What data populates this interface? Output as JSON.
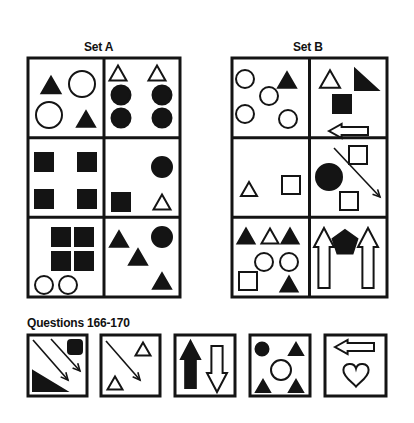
{
  "set_a": {
    "title": "Set A",
    "grid": {
      "x": 28,
      "y": 58,
      "w": 152,
      "h": 239,
      "cols": 2,
      "rows": 3,
      "stroke": 3
    },
    "cells": [
      {
        "name": "a-r1c1",
        "shapes": [
          {
            "t": "tri",
            "cx": 51,
            "cy": 85,
            "s": 19,
            "fill": true
          },
          {
            "t": "circle",
            "cx": 82,
            "cy": 84,
            "r": 13,
            "fill": false
          },
          {
            "t": "circle",
            "cx": 49,
            "cy": 115,
            "r": 13,
            "fill": false
          },
          {
            "t": "tri",
            "cx": 86,
            "cy": 119,
            "s": 18,
            "fill": true
          }
        ]
      },
      {
        "name": "a-r1c2",
        "shapes": [
          {
            "t": "tri",
            "cx": 118,
            "cy": 73,
            "s": 17,
            "fill": false
          },
          {
            "t": "tri",
            "cx": 157,
            "cy": 73,
            "s": 17,
            "fill": false
          },
          {
            "t": "circle",
            "cx": 121,
            "cy": 95,
            "r": 9.5,
            "fill": true
          },
          {
            "t": "circle",
            "cx": 162,
            "cy": 95,
            "r": 9.5,
            "fill": true
          },
          {
            "t": "circle",
            "cx": 121,
            "cy": 118,
            "r": 9.5,
            "fill": true
          },
          {
            "t": "circle",
            "cx": 162,
            "cy": 118,
            "r": 9.5,
            "fill": true
          }
        ]
      },
      {
        "name": "a-r2c1",
        "shapes": [
          {
            "t": "rect",
            "x": 35,
            "y": 153,
            "w": 18,
            "h": 18,
            "fill": true
          },
          {
            "t": "rect",
            "x": 78,
            "y": 153,
            "w": 18,
            "h": 18,
            "fill": true
          },
          {
            "t": "rect",
            "x": 35,
            "y": 190,
            "w": 18,
            "h": 18,
            "fill": true
          },
          {
            "t": "rect",
            "x": 78,
            "y": 190,
            "w": 18,
            "h": 18,
            "fill": true
          }
        ]
      },
      {
        "name": "a-r2c2",
        "shapes": [
          {
            "t": "circle",
            "cx": 162,
            "cy": 167,
            "r": 10,
            "fill": true
          },
          {
            "t": "rect",
            "x": 112,
            "y": 193,
            "w": 18,
            "h": 18,
            "fill": true
          },
          {
            "t": "tri",
            "cx": 162,
            "cy": 202,
            "s": 17,
            "fill": false
          }
        ]
      },
      {
        "name": "a-r3c1",
        "shapes": [
          {
            "t": "rect",
            "x": 52,
            "y": 228,
            "w": 18,
            "h": 18,
            "fill": true
          },
          {
            "t": "rect",
            "x": 75,
            "y": 228,
            "w": 18,
            "h": 18,
            "fill": true
          },
          {
            "t": "rect",
            "x": 52,
            "y": 252,
            "w": 18,
            "h": 18,
            "fill": true
          },
          {
            "t": "rect",
            "x": 75,
            "y": 252,
            "w": 18,
            "h": 18,
            "fill": true
          },
          {
            "t": "circle",
            "cx": 44,
            "cy": 285,
            "r": 9,
            "fill": false
          },
          {
            "t": "circle",
            "cx": 68,
            "cy": 285,
            "r": 9,
            "fill": false
          }
        ]
      },
      {
        "name": "a-r3c2",
        "shapes": [
          {
            "t": "tri",
            "cx": 119,
            "cy": 239,
            "s": 18,
            "fill": true
          },
          {
            "t": "circle",
            "cx": 162,
            "cy": 237,
            "r": 10,
            "fill": true
          },
          {
            "t": "tri",
            "cx": 138,
            "cy": 257,
            "s": 18,
            "fill": true
          },
          {
            "t": "tri",
            "cx": 162,
            "cy": 281,
            "s": 18,
            "fill": true
          }
        ]
      }
    ]
  },
  "set_b": {
    "title": "Set B",
    "grid": {
      "x": 232,
      "y": 58,
      "w": 155,
      "h": 239,
      "cols": 2,
      "rows": 3,
      "stroke": 3
    },
    "cells": [
      {
        "name": "b-r1c1",
        "shapes": [
          {
            "t": "circle",
            "cx": 245,
            "cy": 79,
            "r": 9,
            "fill": false
          },
          {
            "t": "tri",
            "cx": 287,
            "cy": 80,
            "s": 18,
            "fill": true
          },
          {
            "t": "circle",
            "cx": 269,
            "cy": 96,
            "r": 9,
            "fill": false
          },
          {
            "t": "circle",
            "cx": 245,
            "cy": 114,
            "r": 9,
            "fill": false
          },
          {
            "t": "circle",
            "cx": 288,
            "cy": 119,
            "r": 9,
            "fill": false
          }
        ]
      },
      {
        "name": "b-r1c2",
        "shapes": [
          {
            "t": "tri",
            "cx": 330,
            "cy": 79,
            "s": 20,
            "fill": false
          },
          {
            "t": "rtri",
            "x": 355,
            "y": 69,
            "w": 23,
            "h": 21,
            "fill": true
          },
          {
            "t": "rect",
            "x": 333,
            "y": 95,
            "w": 18,
            "h": 18,
            "fill": true
          },
          {
            "t": "harrow",
            "x": 329,
            "y": 124,
            "w": 39,
            "h": 14,
            "dir": "left",
            "fill": false
          }
        ]
      },
      {
        "name": "b-r2c1",
        "shapes": [
          {
            "t": "tri",
            "cx": 249,
            "cy": 189,
            "s": 16,
            "fill": false
          },
          {
            "t": "rect",
            "x": 282,
            "y": 176,
            "w": 18,
            "h": 18,
            "fill": false
          }
        ]
      },
      {
        "name": "b-r2c2",
        "shapes": [
          {
            "t": "rect",
            "x": 349,
            "y": 146,
            "w": 18,
            "h": 18,
            "fill": false
          },
          {
            "t": "circle",
            "cx": 329,
            "cy": 177,
            "r": 13,
            "fill": true
          },
          {
            "t": "arrowline",
            "x1": 334,
            "y1": 148,
            "x2": 380,
            "y2": 197
          },
          {
            "t": "rect",
            "x": 340,
            "y": 192,
            "w": 18,
            "h": 18,
            "fill": false
          }
        ]
      },
      {
        "name": "b-r3c1",
        "shapes": [
          {
            "t": "tri",
            "cx": 246,
            "cy": 236,
            "s": 17,
            "fill": true
          },
          {
            "t": "tri",
            "cx": 270,
            "cy": 236,
            "s": 17,
            "fill": false
          },
          {
            "t": "tri",
            "cx": 290,
            "cy": 236,
            "s": 17,
            "fill": true
          },
          {
            "t": "circle",
            "cx": 264,
            "cy": 262,
            "r": 9,
            "fill": false
          },
          {
            "t": "circle",
            "cx": 289,
            "cy": 262,
            "r": 9,
            "fill": false
          },
          {
            "t": "rect",
            "x": 239,
            "y": 272,
            "w": 18,
            "h": 18,
            "fill": false
          },
          {
            "t": "tri",
            "cx": 289,
            "cy": 284,
            "s": 17,
            "fill": true
          }
        ]
      },
      {
        "name": "b-r3c2",
        "shapes": [
          {
            "t": "varrow",
            "x": 314,
            "y": 228,
            "w": 20,
            "h": 60,
            "dir": "up",
            "fill": false
          },
          {
            "t": "pent",
            "cx": 345,
            "cy": 243,
            "r": 13,
            "fill": true
          },
          {
            "t": "varrow",
            "x": 358,
            "y": 228,
            "w": 20,
            "h": 60,
            "dir": "up",
            "fill": false
          }
        ]
      }
    ]
  },
  "questions": {
    "title": "Questions 166-170",
    "box_stroke": 3,
    "items": [
      {
        "number": "166",
        "box": {
          "x": 28,
          "y": 335,
          "w": 59,
          "h": 61
        },
        "shapes": [
          {
            "t": "arrowline",
            "x1": 33,
            "y1": 340,
            "x2": 68,
            "y2": 380
          },
          {
            "t": "arrowline",
            "x1": 51,
            "y1": 339,
            "x2": 80,
            "y2": 371
          },
          {
            "t": "roundrect",
            "x": 68,
            "y": 340,
            "w": 14,
            "h": 14,
            "fill": true
          },
          {
            "t": "rtri2",
            "x": 33,
            "y": 371,
            "w": 33,
            "h": 20,
            "fill": true
          }
        ]
      },
      {
        "number": "167",
        "box": {
          "x": 101,
          "y": 335,
          "w": 59,
          "h": 61
        },
        "shapes": [
          {
            "t": "arrowline",
            "x1": 106,
            "y1": 341,
            "x2": 140,
            "y2": 380
          },
          {
            "t": "tri",
            "cx": 143,
            "cy": 349,
            "s": 15,
            "fill": false
          },
          {
            "t": "tri",
            "cx": 115,
            "cy": 383,
            "s": 15,
            "fill": false
          }
        ]
      },
      {
        "number": "168",
        "box": {
          "x": 175,
          "y": 335,
          "w": 60,
          "h": 61
        },
        "shapes": [
          {
            "t": "varrow",
            "x": 181,
            "y": 341,
            "w": 19,
            "h": 47,
            "dir": "up",
            "fill": true
          },
          {
            "t": "varrow",
            "x": 207,
            "y": 346,
            "w": 20,
            "h": 46,
            "dir": "down",
            "fill": false
          }
        ]
      },
      {
        "number": "169",
        "box": {
          "x": 250,
          "y": 335,
          "w": 60,
          "h": 61
        },
        "shapes": [
          {
            "t": "circle",
            "cx": 262,
            "cy": 349,
            "r": 6.5,
            "fill": true
          },
          {
            "t": "tri",
            "cx": 296,
            "cy": 349,
            "s": 14,
            "fill": true
          },
          {
            "t": "circle",
            "cx": 281,
            "cy": 370,
            "r": 10,
            "fill": false
          },
          {
            "t": "tri",
            "cx": 263,
            "cy": 386,
            "s": 14,
            "fill": true
          },
          {
            "t": "tri",
            "cx": 296,
            "cy": 386,
            "s": 14,
            "fill": true
          }
        ]
      },
      {
        "number": "170",
        "box": {
          "x": 325,
          "y": 335,
          "w": 61,
          "h": 61
        },
        "shapes": [
          {
            "t": "harrow",
            "x": 335,
            "y": 340,
            "w": 39,
            "h": 14,
            "dir": "left",
            "fill": false
          },
          {
            "t": "heart",
            "cx": 356,
            "cy": 374,
            "s": 24,
            "fill": false
          }
        ]
      }
    ]
  },
  "colors": {
    "ink": "#141414",
    "paper": "#ffffff"
  }
}
